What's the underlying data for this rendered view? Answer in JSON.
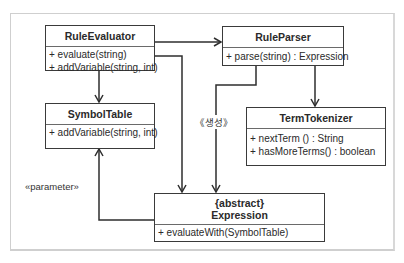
{
  "diagram": {
    "type": "UML class diagram",
    "classes": [
      {
        "id": "rule-evaluator",
        "name": "RuleEvaluator",
        "stereotype": "",
        "operations": [
          "+ evaluate(string)",
          "+ addVariable(string, int)"
        ]
      },
      {
        "id": "rule-parser",
        "name": "RuleParser",
        "stereotype": "",
        "operations": [
          "+ parse(string) : Expression"
        ]
      },
      {
        "id": "symbol-table",
        "name": "SymbolTable",
        "stereotype": "",
        "operations": [
          "+ addVariable(string, int)"
        ]
      },
      {
        "id": "term-tokenizer",
        "name": "TermTokenizer",
        "stereotype": "",
        "operations": [
          "+ nextTerm () : String",
          "+ hasMoreTerms() : boolean"
        ]
      },
      {
        "id": "expression",
        "name": "Expression",
        "stereotype": "{abstract}",
        "operations": [
          "+ evaluateWith(SymbolTable)"
        ]
      }
    ],
    "labels": {
      "create": "《생성》",
      "parameter": "«parameter»"
    },
    "relationships": [
      {
        "from": "RuleEvaluator",
        "to": "RuleParser",
        "kind": "association"
      },
      {
        "from": "RuleEvaluator",
        "to": "SymbolTable",
        "kind": "association"
      },
      {
        "from": "RuleEvaluator",
        "to": "Expression",
        "kind": "association"
      },
      {
        "from": "RuleParser",
        "to": "TermTokenizer",
        "kind": "association"
      },
      {
        "from": "RuleParser",
        "to": "Expression",
        "kind": "dependency",
        "label": "《생성》"
      },
      {
        "from": "Expression",
        "to": "SymbolTable",
        "kind": "dependency",
        "label": "«parameter»"
      }
    ]
  }
}
